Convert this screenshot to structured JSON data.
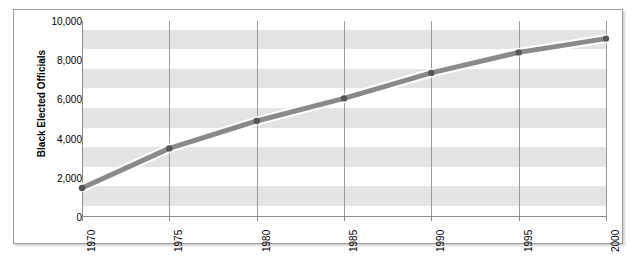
{
  "chart_data": {
    "type": "line",
    "title": "",
    "subtitle": "",
    "xlabel": "",
    "ylabel": "Black Elected Officials",
    "x": [
      1970,
      1975,
      1980,
      1985,
      1990,
      1995,
      2000
    ],
    "categories": [
      "1970",
      "1975",
      "1980",
      "1985",
      "1990",
      "1995",
      "2000"
    ],
    "values": [
      1480,
      3500,
      4900,
      6050,
      7350,
      8400,
      9100
    ],
    "series": [
      {
        "name": "Black Elected Officials",
        "values": [
          1480,
          3500,
          4900,
          6050,
          7350,
          8400,
          9100
        ]
      }
    ],
    "xlim": [
      1970,
      2000
    ],
    "ylim": [
      0,
      10000
    ],
    "ytick_labels": [
      "10,000",
      "8,000",
      "6,000",
      "4,000",
      "2,000",
      "0"
    ],
    "ytick_values": [
      10000,
      8000,
      6000,
      4000,
      2000,
      0
    ],
    "xtick_labels": [
      "1970",
      "1975",
      "1980",
      "1985",
      "1990",
      "1995",
      "2000"
    ],
    "grid": {
      "vertical": true,
      "horizontal": false,
      "alternating_bands": true
    },
    "legend": {
      "visible": false,
      "position": "none"
    },
    "colors": {
      "line": "#8a8a8a",
      "line_highlight": "#ffffff",
      "marker": "#555555",
      "band": "#e4e4e4",
      "background": "#ffffff",
      "gridline": "#9a9a9a",
      "axis": "#8d8d8d",
      "frame_border": "#9b9b9b",
      "text": "#000000"
    },
    "marker_style": "circle",
    "line_width_px": 5
  }
}
